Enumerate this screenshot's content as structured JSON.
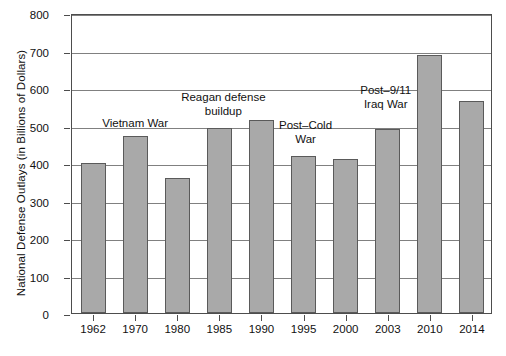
{
  "chart_data": {
    "type": "bar",
    "title": "",
    "xlabel": "",
    "ylabel": "National Defense Outlays (in Billions of Dollars)",
    "ylim": [
      0,
      800
    ],
    "ytick_step": 100,
    "grid": true,
    "legend": "none",
    "bar_color": "#a9a9a9",
    "bar_edge_color": "#5a5a5a",
    "categories": [
      "1962",
      "1970",
      "1980",
      "1985",
      "1990",
      "1995",
      "2000",
      "2003",
      "2010",
      "2014"
    ],
    "values": [
      400,
      471,
      361,
      493,
      516,
      420,
      410,
      490,
      688,
      566
    ],
    "yticks": [
      "0",
      "100",
      "200",
      "300",
      "400",
      "500",
      "600",
      "700",
      "800"
    ],
    "annotations": [
      {
        "text_lines": [
          "Vietnam War"
        ],
        "near_category": "1970"
      },
      {
        "text_lines": [
          "Reagan defense",
          "buildup"
        ],
        "near_category": "1985"
      },
      {
        "text_lines": [
          "Post–Cold",
          "War"
        ],
        "near_category": "1995"
      },
      {
        "text_lines": [
          "Post–9/11",
          "Iraq War"
        ],
        "near_category": "2003"
      }
    ]
  },
  "annotation_text": {
    "vietnam_war": "Vietnam War",
    "reagan_line1": "Reagan defense",
    "reagan_line2": "buildup",
    "postcold_line1": "Post–Cold",
    "postcold_line2": "War",
    "post911_line1": "Post–9/11",
    "post911_line2": "Iraq War"
  }
}
